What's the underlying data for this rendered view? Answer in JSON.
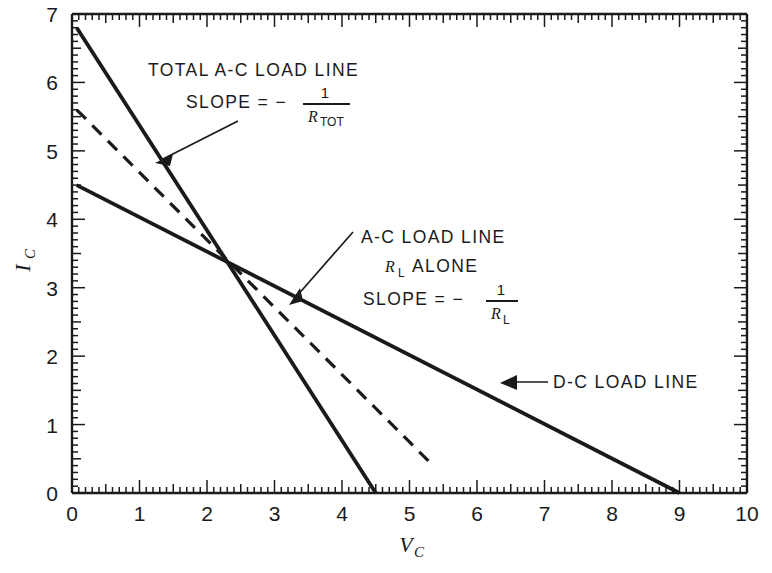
{
  "chart_data": {
    "type": "line",
    "title": "",
    "xlabel": "V_C",
    "ylabel": "I_C",
    "xlim": [
      0,
      10
    ],
    "ylim": [
      0,
      7
    ],
    "grid": false,
    "legend_position": "inline-annotations",
    "x_ticks": [
      "0",
      "1",
      "2",
      "3",
      "4",
      "5",
      "6",
      "7",
      "8",
      "9",
      "10"
    ],
    "y_ticks": [
      "0",
      "1",
      "2",
      "3",
      "4",
      "5",
      "6",
      "7"
    ],
    "x_tick_minor_step": 0.1,
    "x_tick_major_step": 1,
    "y_tick_minor_step": 0.1,
    "y_tick_major_step": 1,
    "series": [
      {
        "name": "TOTAL A-C LOAD LINE",
        "style": "solid",
        "x": [
          0.07,
          4.5
        ],
        "y": [
          6.8,
          0
        ],
        "slope": -1.53,
        "note": "slope = -1/R_TOT"
      },
      {
        "name": "A-C LOAD LINE R_L ALONE",
        "style": "dashed",
        "x": [
          0.07,
          5.35
        ],
        "y": [
          5.6,
          0.4
        ],
        "slope": -0.985,
        "note": "slope = -1/R_L"
      },
      {
        "name": "D-C LOAD LINE",
        "style": "solid",
        "x": [
          0.07,
          9.0
        ],
        "y": [
          4.5,
          0
        ],
        "slope": -0.5,
        "note": "d-c load line"
      }
    ],
    "intersection": {
      "x": 2.27,
      "y": 3.45
    }
  },
  "annotations": {
    "total_ac": {
      "line1": "TOTAL A-C LOAD LINE",
      "slope_label": "SLOPE  =  −",
      "frac_numerator": "1",
      "frac_denominator": "R",
      "frac_denominator_sub": "TOT"
    },
    "ac_rl": {
      "line1": "A-C LOAD LINE",
      "line2_r": "R",
      "line2_sub": "L",
      "line2_rest": "ALONE",
      "slope_label": "SLOPE  =  −",
      "frac_numerator": "1",
      "frac_denominator": "R",
      "frac_denominator_sub": "L"
    },
    "dc": {
      "label": "D-C LOAD LINE"
    }
  },
  "axes": {
    "y_label_main": "I",
    "y_label_sub": "C",
    "x_label_main": "V",
    "x_label_sub": "C"
  },
  "colors": {
    "ink": "#1a1a1a",
    "background": "#ffffff"
  }
}
